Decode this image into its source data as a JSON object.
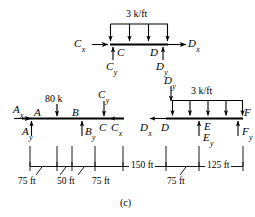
{
  "figure": {
    "caption": "(c)",
    "type": "free-body-diagram"
  },
  "top_member": {
    "name": "member-CD",
    "distributed_load": "3 k/ft",
    "nodes": {
      "left_point": "C",
      "right_point": "D"
    },
    "forces": {
      "cx": "C",
      "cx_sub": "x",
      "cy": "C",
      "cy_sub": "y",
      "dx": "D",
      "dx_sub": "x",
      "dy": "D",
      "dy_sub": "y"
    }
  },
  "transfer": {
    "dy": "D",
    "dy_sub": "y"
  },
  "left_member": {
    "name": "member-ABC",
    "point_load": "80 k",
    "nodes": {
      "a": "A",
      "b": "B",
      "c": "C"
    },
    "forces": {
      "ax": "A",
      "ax_sub": "x",
      "ay": "A",
      "ay_sub": "y",
      "by": "B",
      "by_sub": "y",
      "cx": "C",
      "cx_sub": "x",
      "cy": "C",
      "cy_sub": "y"
    }
  },
  "right_member": {
    "name": "member-DEF",
    "distributed_load": "3 k/ft",
    "nodes": {
      "d": "D",
      "e": "E",
      "f": "F"
    },
    "forces": {
      "dx": "D",
      "dx_sub": "x",
      "ey": "E",
      "ey_sub": "y",
      "fy": "F",
      "fy_sub": "y"
    }
  },
  "dimensions": {
    "d1": "75 ft",
    "d2": "50 ft",
    "d3": "75 ft",
    "d4": "150 ft",
    "d5": "75 ft",
    "d6": "125 ft"
  },
  "colors": {
    "ink": "#000000",
    "paper": "#ffffff"
  }
}
